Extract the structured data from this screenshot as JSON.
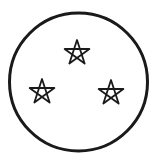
{
  "figure": {
    "stroke_color": "#1a1a1a",
    "background": "#ffffff",
    "circle": {
      "cx": 78.5,
      "cy": 82,
      "r": 69,
      "stroke_width": 3
    },
    "stars": [
      {
        "name": "top-star",
        "cx": 77,
        "cy": 53,
        "r": 13
      },
      {
        "name": "left-star",
        "cx": 42,
        "cy": 92,
        "r": 13
      },
      {
        "name": "right-star",
        "cx": 111,
        "cy": 93,
        "r": 13
      }
    ]
  }
}
